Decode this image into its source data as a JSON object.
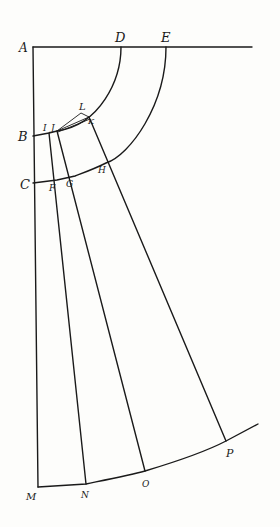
{
  "diagram": {
    "type": "geometric-construction",
    "colors": {
      "ink": "#1a1a1a",
      "paper": "#fdfdfb"
    },
    "labels": {
      "A": "A",
      "B": "B",
      "C": "C",
      "D": "D",
      "E": "E",
      "F": "F",
      "G": "G",
      "H": "H",
      "I": "I",
      "J": "J",
      "K": "K",
      "L": "L",
      "M": "M",
      "N": "N",
      "O": "O",
      "P": "P"
    },
    "points": {
      "A": [
        33,
        47
      ],
      "B": [
        33,
        136
      ],
      "C": [
        33,
        183
      ],
      "D": [
        121,
        47
      ],
      "E": [
        166,
        47
      ],
      "I": [
        49,
        133
      ],
      "J": [
        57,
        131
      ],
      "K": [
        89,
        117
      ],
      "L": [
        81,
        113
      ],
      "F": [
        57,
        180
      ],
      "G": [
        75,
        176
      ],
      "H": [
        106,
        163
      ],
      "M": [
        38,
        487
      ],
      "N": [
        86,
        484
      ],
      "O": [
        145,
        471
      ],
      "P": [
        226,
        441
      ]
    }
  }
}
